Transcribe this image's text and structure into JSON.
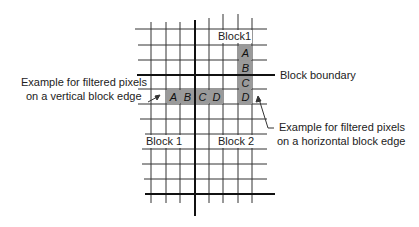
{
  "labels": {
    "block1_top": "Block1",
    "block_boundary": "Block boundary",
    "vertical_edge_line1": "Example for filtered pixels",
    "vertical_edge_line2": "on a vertical block edge",
    "horizontal_edge_line1": "Example for filtered pixels",
    "horizontal_edge_line2": "on a horizontal block edge",
    "block1_bottom": "Block 1",
    "block2_bottom": "Block 2"
  },
  "horizontal_pixels": [
    "A",
    "B",
    "C",
    "D"
  ],
  "vertical_pixels": [
    "A",
    "B",
    "C",
    "D"
  ],
  "colors": {
    "pixel_fill": "#9a9a9a",
    "grid": "#222222"
  }
}
